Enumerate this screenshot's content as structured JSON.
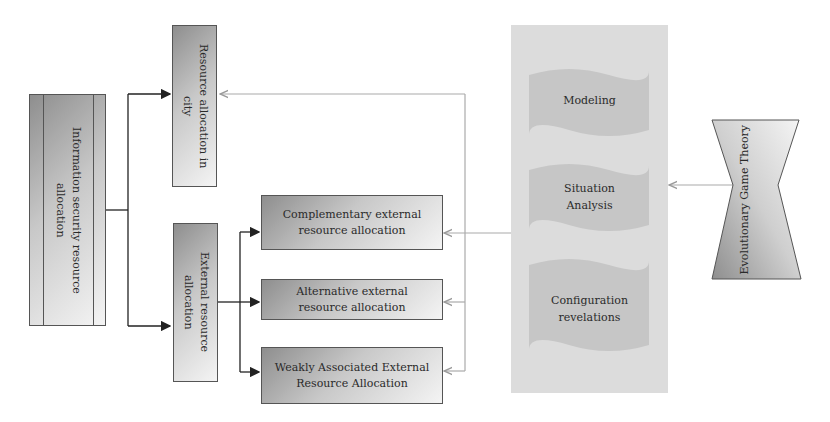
{
  "diagram": {
    "root": {
      "label": "Information security resource\nallocation"
    },
    "city_box": {
      "label": "Resource allocation in\ncity"
    },
    "external_box": {
      "label": "External resource\nallocation"
    },
    "sub_boxes": [
      {
        "label": "Complementary external\nresource allocation"
      },
      {
        "label": "Alternative external\nresource allocation"
      },
      {
        "label": "Weakly Associated External\nResource Allocation"
      }
    ],
    "method_panel": {
      "steps": [
        {
          "label": "Modeling"
        },
        {
          "label": "Situation\nAnalysis"
        },
        {
          "label": "Configuration\nrevelations"
        }
      ]
    },
    "theory": {
      "label": "Evolutionary Game Theory"
    },
    "colors": {
      "dark_connector": "#222222",
      "light_connector": "#aaaaaa",
      "panel_bg": "#dcdcdc",
      "wave_fill": "#c4c4c4"
    }
  }
}
